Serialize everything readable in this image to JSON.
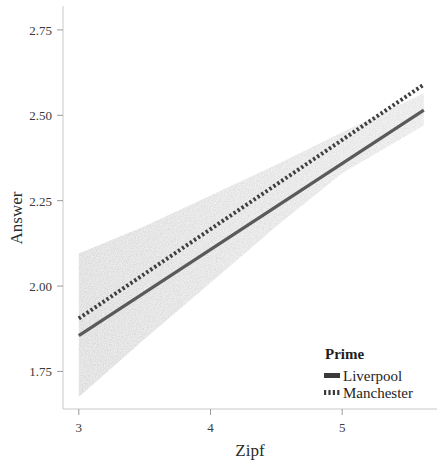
{
  "chart_data": {
    "type": "line",
    "title": "",
    "subtitle": "",
    "xlabel": "Zipf",
    "ylabel": "Answer",
    "xlim": [
      2.88,
      5.72
    ],
    "ylim": [
      1.64,
      2.82
    ],
    "xticks": [
      3,
      4,
      5
    ],
    "xtick_labels": [
      "3",
      "4",
      "5"
    ],
    "yticks": [
      1.75,
      2.0,
      2.25,
      2.5,
      2.75
    ],
    "ytick_labels": [
      "1.75",
      "2.00",
      "2.25",
      "2.50",
      "2.75"
    ],
    "grid": false,
    "legend_position": "bottom-right",
    "legend_title": "Prime",
    "series": [
      {
        "name": "Liverpool",
        "style": "solid",
        "color": "#5a5a5a",
        "x": [
          3.0,
          5.62
        ],
        "values": [
          1.855,
          2.515
        ],
        "ci_band": {
          "x": [
            3.0,
            3.5,
            4.0,
            4.5,
            5.0,
            5.62
          ],
          "lower": [
            1.675,
            1.845,
            2.01,
            2.175,
            2.33,
            2.47
          ],
          "upper": [
            2.095,
            2.175,
            2.265,
            2.355,
            2.45,
            2.565
          ],
          "color": "#e6e6e6"
        }
      },
      {
        "name": "Manchester",
        "style": "dotted",
        "color": "#3f3f3f",
        "x": [
          3.0,
          5.62
        ],
        "values": [
          1.905,
          2.59
        ],
        "ci_band": {
          "x": [
            3.0,
            3.5,
            4.0,
            4.5,
            5.0,
            5.62
          ],
          "lower": [
            1.675,
            1.845,
            2.01,
            2.175,
            2.33,
            2.47
          ],
          "upper": [
            2.095,
            2.175,
            2.265,
            2.355,
            2.45,
            2.565
          ],
          "color": "#e6e6e6"
        }
      }
    ],
    "legend_entries": [
      {
        "label": "Liverpool",
        "style": "solid"
      },
      {
        "label": "Manchester",
        "style": "dotted"
      }
    ],
    "colors": {
      "line_liverpool": "#5a5a5a",
      "line_manchester": "#3f3f3f",
      "confidence_band": "#e6e6e6",
      "axis": "#c9c9c9",
      "text": "#2b2b2b",
      "background": "#ffffff"
    }
  },
  "axes": {
    "y_title": "Answer",
    "x_title": "Zipf",
    "y_tick_0": "1.75",
    "y_tick_1": "2.00",
    "y_tick_2": "2.25",
    "y_tick_3": "2.50",
    "y_tick_4": "2.75",
    "x_tick_0": "3",
    "x_tick_1": "4",
    "x_tick_2": "5"
  },
  "legend": {
    "title": "Prime",
    "item_0": "Liverpool",
    "item_1": "Manchester"
  }
}
